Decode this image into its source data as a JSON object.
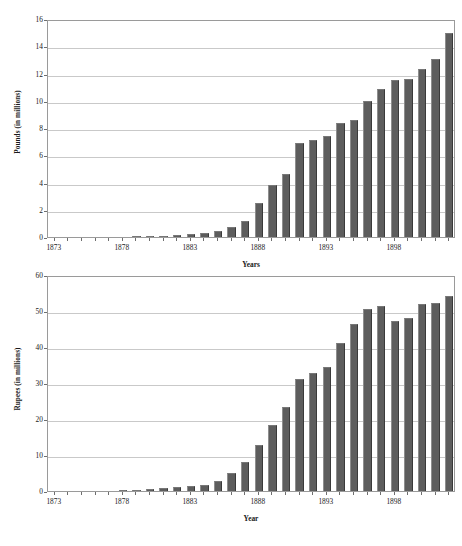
{
  "chart_data": [
    {
      "id": "pounds",
      "type": "bar",
      "title": "",
      "xlabel": "Years",
      "ylabel": "Pounds (in millions)",
      "ylim": [
        0,
        16
      ],
      "ytick_values": [
        0,
        2,
        4,
        6,
        8,
        10,
        12,
        14,
        16
      ],
      "ytick_labels": [
        "0",
        "2",
        "4",
        "6",
        "8",
        "10",
        "12",
        "14",
        "16"
      ],
      "grid": true,
      "legend": "none",
      "bar_color": "#5d5d5d",
      "x": [
        1873,
        1874,
        1875,
        1876,
        1877,
        1878,
        1879,
        1880,
        1881,
        1882,
        1883,
        1884,
        1885,
        1886,
        1887,
        1888,
        1889,
        1890,
        1891,
        1892,
        1893,
        1894,
        1895,
        1896,
        1897,
        1898,
        1899,
        1900,
        1901,
        1902
      ],
      "values": [
        0.0,
        0.0,
        0.0,
        0.0,
        0.0,
        0.02,
        0.03,
        0.05,
        0.08,
        0.15,
        0.25,
        0.3,
        0.45,
        0.7,
        1.2,
        2.5,
        3.8,
        4.6,
        6.9,
        7.1,
        7.4,
        8.4,
        8.6,
        10.0,
        10.9,
        11.5,
        11.6,
        12.3,
        13.1,
        15.0
      ],
      "xtick_labels": [
        "1873",
        "1878",
        "1883",
        "1888",
        "1893",
        "1898"
      ],
      "xtick_values": [
        1873,
        1878,
        1883,
        1888,
        1893,
        1898
      ]
    },
    {
      "id": "rupees",
      "type": "bar",
      "title": "",
      "xlabel": "Year",
      "ylabel": "Rupees (in millions)",
      "ylim": [
        0,
        60
      ],
      "ytick_values": [
        0,
        10,
        20,
        30,
        40,
        50,
        60
      ],
      "ytick_labels": [
        "0",
        "10",
        "20",
        "30",
        "40",
        "50",
        "60"
      ],
      "grid": true,
      "legend": "none",
      "bar_color": "#5d5d5d",
      "x": [
        1873,
        1874,
        1875,
        1876,
        1877,
        1878,
        1879,
        1880,
        1881,
        1882,
        1883,
        1884,
        1885,
        1886,
        1887,
        1888,
        1889,
        1890,
        1891,
        1892,
        1893,
        1894,
        1895,
        1896,
        1897,
        1898,
        1899,
        1900,
        1901,
        1902
      ],
      "values": [
        0.0,
        0.0,
        0.0,
        0.0,
        0.0,
        0.2,
        0.3,
        0.5,
        0.8,
        1.2,
        1.5,
        1.8,
        2.8,
        5.0,
        8.0,
        12.8,
        18.3,
        23.2,
        31.0,
        32.8,
        34.5,
        41.2,
        46.3,
        50.5,
        51.3,
        47.2,
        48.0,
        52.0,
        52.2,
        54.2
      ],
      "xtick_labels": [
        "1873",
        "1878",
        "1883",
        "1888",
        "1893",
        "1898"
      ],
      "xtick_values": [
        1873,
        1878,
        1883,
        1888,
        1893,
        1898
      ]
    }
  ]
}
